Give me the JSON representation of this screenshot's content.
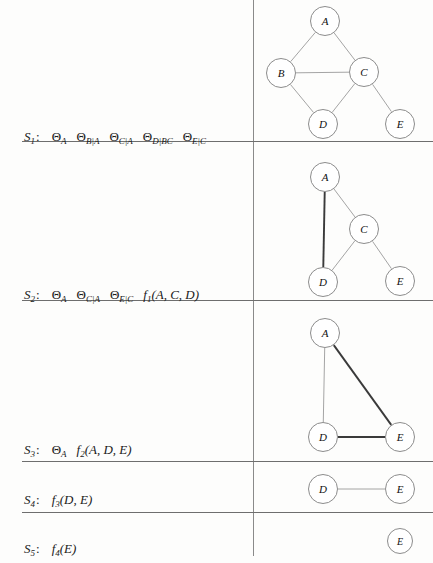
{
  "figure": {
    "divider_x": 253,
    "rows": [
      {
        "id": "S1",
        "label_sym": "S",
        "label_sub": "1",
        "label_y": 130,
        "terms": [
          {
            "kind": "theta",
            "base": "Θ",
            "sub": "A"
          },
          {
            "kind": "theta",
            "base": "Θ",
            "sub": "B|A"
          },
          {
            "kind": "theta",
            "base": "Θ",
            "sub": "C|A"
          },
          {
            "kind": "theta",
            "base": "Θ",
            "sub": "D|BC"
          },
          {
            "kind": "theta",
            "base": "Θ",
            "sub": "E|C"
          }
        ],
        "rule_y": 141,
        "graph": {
          "nodes": [
            {
              "id": "A",
              "label": "A",
              "x": 325,
              "y": 21,
              "size": 30
            },
            {
              "id": "B",
              "label": "B",
              "x": 281,
              "y": 73,
              "size": 30
            },
            {
              "id": "C",
              "label": "C",
              "x": 364,
              "y": 72,
              "size": 30
            },
            {
              "id": "D",
              "label": "D",
              "x": 323,
              "y": 124,
              "size": 30
            },
            {
              "id": "E",
              "label": "E",
              "x": 400,
              "y": 124,
              "size": 30
            }
          ],
          "edges": [
            {
              "from": "A",
              "to": "B",
              "weight": "thin"
            },
            {
              "from": "A",
              "to": "C",
              "weight": "thin"
            },
            {
              "from": "B",
              "to": "C",
              "weight": "thin"
            },
            {
              "from": "B",
              "to": "D",
              "weight": "thin"
            },
            {
              "from": "C",
              "to": "D",
              "weight": "thin"
            },
            {
              "from": "C",
              "to": "E",
              "weight": "thin"
            }
          ]
        }
      },
      {
        "id": "S2",
        "label_sym": "S",
        "label_sub": "2",
        "label_y": 288,
        "terms": [
          {
            "kind": "theta",
            "base": "Θ",
            "sub": "A"
          },
          {
            "kind": "theta",
            "base": "Θ",
            "sub": "C|A"
          },
          {
            "kind": "theta",
            "base": "Θ",
            "sub": "E|C"
          },
          {
            "kind": "func",
            "base": "f",
            "sub": "1",
            "args": "(A, C, D)"
          }
        ],
        "rule_y": 300,
        "graph": {
          "nodes": [
            {
              "id": "A",
              "label": "A",
              "x": 325,
              "y": 177,
              "size": 30
            },
            {
              "id": "C",
              "label": "C",
              "x": 364,
              "y": 229,
              "size": 30
            },
            {
              "id": "D",
              "label": "D",
              "x": 323,
              "y": 282,
              "size": 30
            },
            {
              "id": "E",
              "label": "E",
              "x": 400,
              "y": 281,
              "size": 30
            }
          ],
          "edges": [
            {
              "from": "A",
              "to": "C",
              "weight": "thin"
            },
            {
              "from": "A",
              "to": "D",
              "weight": "thick"
            },
            {
              "from": "C",
              "to": "D",
              "weight": "thin"
            },
            {
              "from": "C",
              "to": "E",
              "weight": "thin"
            }
          ]
        }
      },
      {
        "id": "S3",
        "label_sym": "S",
        "label_sub": "3",
        "label_y": 443,
        "terms": [
          {
            "kind": "theta",
            "base": "Θ",
            "sub": "A"
          },
          {
            "kind": "func",
            "base": "f",
            "sub": "2",
            "args": "(A, D, E)"
          }
        ],
        "rule_y": 461,
        "graph": {
          "nodes": [
            {
              "id": "A",
              "label": "A",
              "x": 325,
              "y": 333,
              "size": 30
            },
            {
              "id": "D",
              "label": "D",
              "x": 323,
              "y": 437,
              "size": 30
            },
            {
              "id": "E",
              "label": "E",
              "x": 400,
              "y": 437,
              "size": 30
            }
          ],
          "edges": [
            {
              "from": "A",
              "to": "D",
              "weight": "thin"
            },
            {
              "from": "A",
              "to": "E",
              "weight": "thick"
            },
            {
              "from": "D",
              "to": "E",
              "weight": "thick"
            }
          ]
        }
      },
      {
        "id": "S4",
        "label_sym": "S",
        "label_sub": "4",
        "label_y": 493,
        "terms": [
          {
            "kind": "func",
            "base": "f",
            "sub": "3",
            "args": "(D, E)"
          }
        ],
        "rule_y": 512,
        "graph": {
          "nodes": [
            {
              "id": "D",
              "label": "D",
              "x": 323,
              "y": 489,
              "size": 30
            },
            {
              "id": "E",
              "label": "E",
              "x": 400,
              "y": 489,
              "size": 30
            }
          ],
          "edges": [
            {
              "from": "D",
              "to": "E",
              "weight": "thin"
            }
          ]
        }
      },
      {
        "id": "S5",
        "label_sym": "S",
        "label_sub": "5",
        "label_y": 542,
        "terms": [
          {
            "kind": "func",
            "base": "f",
            "sub": "4",
            "args": "(E)"
          }
        ],
        "rule_y": null,
        "graph": {
          "nodes": [
            {
              "id": "E",
              "label": "E",
              "x": 400,
              "y": 541,
              "size": 26
            }
          ],
          "edges": []
        }
      }
    ]
  }
}
